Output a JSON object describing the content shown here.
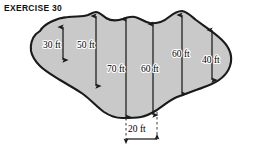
{
  "figure": {
    "title": "EXERCISE 30",
    "shape_name": "irregular-land-region",
    "fill_color": "#c9c9c9",
    "outline_color": "#1a1a1a",
    "background_color": "#ffffff",
    "arrow_color": "#1a1a1a",
    "dashed_color": "#3a3a3a"
  },
  "measurements": {
    "vertical": [
      {
        "label": "30 ft",
        "value": 30,
        "unit": "ft",
        "name": "offset-30ft"
      },
      {
        "label": "50 ft",
        "value": 50,
        "unit": "ft",
        "name": "offset-50ft"
      },
      {
        "label": "70 ft",
        "value": 70,
        "unit": "ft",
        "name": "offset-70ft"
      },
      {
        "label": "60 ft",
        "value": 60,
        "unit": "ft",
        "name": "offset-60ft-a"
      },
      {
        "label": "60 ft",
        "value": 60,
        "unit": "ft",
        "name": "offset-60ft-b"
      },
      {
        "label": "40 ft",
        "value": 40,
        "unit": "ft",
        "name": "offset-40ft"
      }
    ],
    "horizontal": [
      {
        "label": "20 ft",
        "value": 20,
        "unit": "ft",
        "name": "spacing-20ft"
      }
    ]
  }
}
